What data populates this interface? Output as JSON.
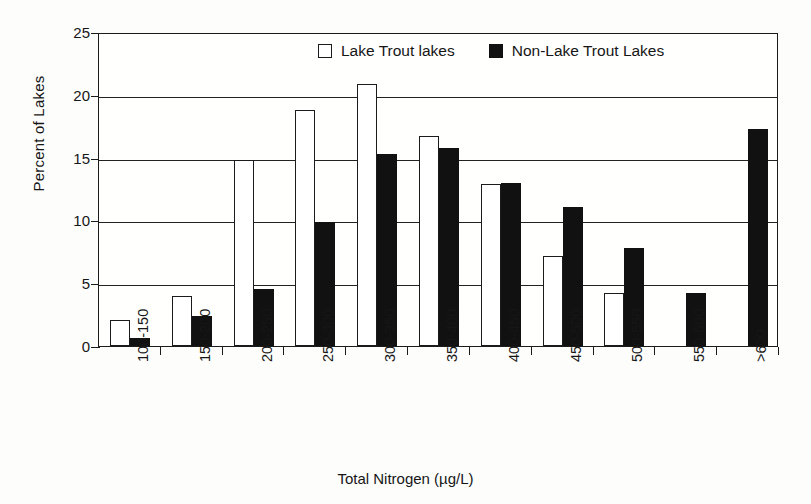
{
  "chart_data": {
    "type": "bar",
    "title": "",
    "xlabel": "Total Nitrogen (µg/L)",
    "ylabel": "Percent of Lakes",
    "ylim": [
      0,
      25
    ],
    "ytick_values": [
      0,
      5,
      10,
      15,
      20,
      25
    ],
    "ytick_labels": [
      "0",
      "5",
      "10",
      "15",
      "20",
      "25"
    ],
    "grid": "horizontal",
    "legend_position": "top-center-inside",
    "categories": [
      "100-150",
      "150-200",
      "200-250",
      "250-300",
      "300-350",
      "350-400",
      "400-450",
      "450-500",
      "500-550",
      "550-600",
      ">600"
    ],
    "series": [
      {
        "name": "Lake Trout lakes",
        "color": "#ffffff",
        "edge_color": "#1b1b1b",
        "values": [
          2.1,
          4.0,
          14.8,
          18.8,
          20.9,
          16.7,
          12.9,
          7.2,
          4.2,
          0,
          0
        ]
      },
      {
        "name": "Non-Lake Trout Lakes",
        "color": "#111111",
        "edge_color": "#111111",
        "values": [
          0.6,
          2.4,
          4.5,
          9.9,
          15.3,
          15.8,
          13.0,
          11.1,
          7.8,
          4.2,
          17.3
        ]
      }
    ]
  },
  "legend": {
    "entries": [
      {
        "label": "Lake Trout lakes",
        "swatch": "white-square-icon"
      },
      {
        "label": "Non-Lake Trout Lakes",
        "swatch": "black-square-icon"
      }
    ]
  },
  "colors": {
    "background": "#fdfdfc",
    "axis": "#1b1b1b",
    "grid": "#222222",
    "series_white": "#ffffff",
    "series_black": "#111111"
  }
}
